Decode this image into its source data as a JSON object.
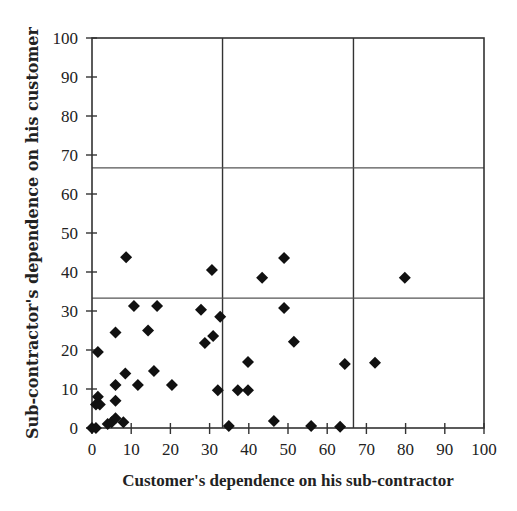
{
  "chart_data": {
    "type": "scatter",
    "title": "",
    "xlabel": "Customer's dependence on his sub-contractor",
    "ylabel": "Sub-contractor's dependence on his customer",
    "xlim": [
      0,
      100
    ],
    "ylim": [
      0,
      100
    ],
    "xticks": [
      0,
      10,
      20,
      30,
      40,
      50,
      60,
      70,
      80,
      90,
      100
    ],
    "yticks": [
      0,
      10,
      20,
      30,
      40,
      50,
      60,
      70,
      80,
      90,
      100
    ],
    "grid": {
      "vertical_lines": [
        33.3,
        66.7
      ],
      "horizontal_lines": [
        33.3,
        66.7
      ]
    },
    "marker": "diamond",
    "marker_color": "#111111",
    "series": [
      {
        "name": "observations",
        "points": [
          {
            "x": 0,
            "y": 0
          },
          {
            "x": 1,
            "y": 0
          },
          {
            "x": 1,
            "y": 6
          },
          {
            "x": 2,
            "y": 6
          },
          {
            "x": 1.5,
            "y": 8
          },
          {
            "x": 1.5,
            "y": 19.5
          },
          {
            "x": 4,
            "y": 1
          },
          {
            "x": 5,
            "y": 1.5
          },
          {
            "x": 6,
            "y": 2.5
          },
          {
            "x": 6,
            "y": 7
          },
          {
            "x": 6,
            "y": 11
          },
          {
            "x": 6,
            "y": 24.5
          },
          {
            "x": 8,
            "y": 1.5
          },
          {
            "x": 8.5,
            "y": 14
          },
          {
            "x": 8.7,
            "y": 43.8
          },
          {
            "x": 10.7,
            "y": 31.3
          },
          {
            "x": 11.7,
            "y": 11
          },
          {
            "x": 14.3,
            "y": 25
          },
          {
            "x": 15.8,
            "y": 14.6
          },
          {
            "x": 16.6,
            "y": 31.3
          },
          {
            "x": 20.4,
            "y": 11
          },
          {
            "x": 27.8,
            "y": 30.3
          },
          {
            "x": 28.8,
            "y": 21.8
          },
          {
            "x": 30.6,
            "y": 40.5
          },
          {
            "x": 30.9,
            "y": 23.6
          },
          {
            "x": 32.1,
            "y": 9.7
          },
          {
            "x": 32.7,
            "y": 28.5
          },
          {
            "x": 34.9,
            "y": 0.5
          },
          {
            "x": 37.2,
            "y": 9.7
          },
          {
            "x": 39.8,
            "y": 9.7
          },
          {
            "x": 39.8,
            "y": 16.9
          },
          {
            "x": 43.4,
            "y": 38.5
          },
          {
            "x": 46.4,
            "y": 1.8
          },
          {
            "x": 49,
            "y": 30.8
          },
          {
            "x": 49,
            "y": 43.6
          },
          {
            "x": 51.5,
            "y": 22.1
          },
          {
            "x": 55.9,
            "y": 0.5
          },
          {
            "x": 63.3,
            "y": 0.3
          },
          {
            "x": 64.5,
            "y": 16.4
          },
          {
            "x": 72.2,
            "y": 16.7
          },
          {
            "x": 79.8,
            "y": 38.5
          }
        ]
      }
    ]
  }
}
